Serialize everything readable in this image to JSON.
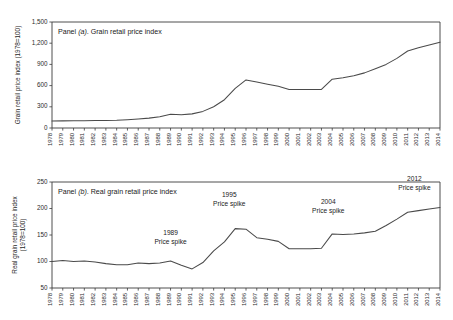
{
  "figure": {
    "name": "grain-retail-price-index-figure"
  },
  "panel_a": {
    "caption_prefix": "Panel ",
    "caption_italic": "(a)",
    "caption_suffix": ". Grain retail price index",
    "caption_full": "Panel (a). Grain retail price index",
    "axis_title": "Grain retail price index (1978=100)"
  },
  "panel_b": {
    "caption_prefix": "Panel ",
    "caption_italic": "(b)",
    "caption_suffix": ". Real grain retail price index",
    "caption_full": "Panel (b). Real grain retail price index",
    "axis_title_line1": "Real grain retail price index",
    "axis_title_line2": "(1978=100)",
    "annotations": [
      {
        "year_label": "1989",
        "text_label": "Price spike"
      },
      {
        "year_label": "1995",
        "text_label": "Price spike"
      },
      {
        "year_label": "2004",
        "text_label": "Price spike"
      },
      {
        "year_label": "2012",
        "text_label": "Price spike"
      }
    ]
  },
  "chart_data": [
    {
      "id": "panel-a",
      "type": "line",
      "title": "Panel (a). Grain retail price index",
      "xlabel": "",
      "ylabel": "Grain retail price index (1978=100)",
      "ylim": [
        0,
        1500
      ],
      "yticks": [
        0,
        300,
        600,
        900,
        1200,
        1500
      ],
      "ytick_labels": [
        "0",
        "300",
        "600",
        "900",
        "1,200",
        "1,500"
      ],
      "grid": false,
      "legend": "none",
      "x": [
        1978,
        1979,
        1980,
        1981,
        1982,
        1983,
        1984,
        1985,
        1986,
        1987,
        1988,
        1989,
        1990,
        1991,
        1992,
        1993,
        1994,
        1995,
        1996,
        1997,
        1998,
        1999,
        2000,
        2001,
        2002,
        2003,
        2004,
        2005,
        2006,
        2007,
        2008,
        2009,
        2010,
        2011,
        2012,
        2013,
        2014
      ],
      "xtick_labels": [
        "1978",
        "1979",
        "1980",
        "1981",
        "1982",
        "1983",
        "1984",
        "1985",
        "1986",
        "1987",
        "1988",
        "1989",
        "1990",
        "1991",
        "1992",
        "1993",
        "1994",
        "1995",
        "1996",
        "1997",
        "1998",
        "1999",
        "2000",
        "2001",
        "2002",
        "2003",
        "2004",
        "2005",
        "2006",
        "2007",
        "2008",
        "2009",
        "2010",
        "2011",
        "2012",
        "2013",
        "2014"
      ],
      "values": [
        100,
        101,
        102,
        103,
        105,
        107,
        110,
        118,
        128,
        140,
        160,
        195,
        188,
        200,
        235,
        300,
        400,
        560,
        680,
        650,
        620,
        590,
        545,
        545,
        545,
        545,
        690,
        710,
        740,
        780,
        840,
        900,
        985,
        1090,
        1135,
        1175,
        1215
      ]
    },
    {
      "id": "panel-b",
      "type": "line",
      "title": "Panel (b). Real grain retail price index",
      "xlabel": "",
      "ylabel": "Real grain retail price index (1978=100)",
      "ylim": [
        50,
        250
      ],
      "yticks": [
        50,
        100,
        150,
        200,
        250
      ],
      "ytick_labels": [
        "50",
        "100",
        "150",
        "200",
        "250"
      ],
      "grid": false,
      "legend": "none",
      "x": [
        1978,
        1979,
        1980,
        1981,
        1982,
        1983,
        1984,
        1985,
        1986,
        1987,
        1988,
        1989,
        1990,
        1991,
        1992,
        1993,
        1994,
        1995,
        1996,
        1997,
        1998,
        1999,
        2000,
        2001,
        2002,
        2003,
        2004,
        2005,
        2006,
        2007,
        2008,
        2009,
        2010,
        2011,
        2012,
        2013,
        2014
      ],
      "xtick_labels": [
        "1978",
        "1979",
        "1980",
        "1981",
        "1982",
        "1983",
        "1984",
        "1985",
        "1986",
        "1987",
        "1988",
        "1989",
        "1990",
        "1991",
        "1992",
        "1993",
        "1994",
        "1995",
        "1996",
        "1997",
        "1998",
        "1999",
        "2000",
        "2001",
        "2002",
        "2003",
        "2004",
        "2005",
        "2006",
        "2007",
        "2008",
        "2009",
        "2010",
        "2011",
        "2012",
        "2013",
        "2014"
      ],
      "values": [
        100,
        102,
        100,
        101,
        99,
        96,
        94,
        94,
        97,
        96,
        97,
        101,
        93,
        86,
        98,
        120,
        137,
        162,
        161,
        145,
        142,
        138,
        124,
        124,
        124,
        125,
        152,
        151,
        152,
        154,
        157,
        168,
        180,
        193,
        196,
        199,
        202
      ],
      "annotations": [
        {
          "year": 1989,
          "label_line1": "1989",
          "label_line2": "Price spike"
        },
        {
          "year": 1995,
          "label_line1": "1995",
          "label_line2": "Price spike"
        },
        {
          "year": 2004,
          "label_line1": "2004",
          "label_line2": "Price spike"
        },
        {
          "year": 2012,
          "label_line1": "2012",
          "label_line2": "Price spike"
        }
      ]
    }
  ]
}
